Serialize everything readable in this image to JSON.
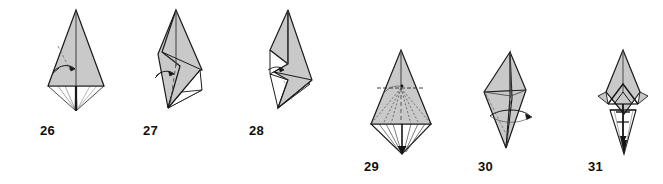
{
  "document": {
    "type": "origami-instruction-diagram",
    "background_color": "#ffffff",
    "paper_front_color": "#c9c9c9",
    "paper_back_color": "#ffffff",
    "outline_color": "#1a1a1a",
    "fold_line_color": "#4a4a4a",
    "arrow_color": "#141414",
    "label_color": "#100f0f",
    "step_count": 6
  },
  "steps": [
    {
      "number": "26",
      "label": "26",
      "name": "step-26",
      "description": "Wide gray kite with vertical center fold, valley-fold arrow at left, thin white flaps tapering to a point below",
      "arrow": "valley-fold-arrow-right",
      "label_x": 40,
      "label_y": 124
    },
    {
      "number": "27",
      "label": "27",
      "name": "step-27",
      "description": "Narrow tilted form, gray front panel folded to the right, dashed vertical fold line, small arrow at left",
      "arrow": "valley-fold-arrow-right",
      "label_x": 143,
      "label_y": 124
    },
    {
      "number": "28",
      "label": "28",
      "name": "step-28",
      "description": "Narrow tilted form with white reverse-side panels exposed on the left edge, zig-zag fold",
      "arrow": "valley-fold-arrow-right",
      "label_x": 249,
      "label_y": 124
    },
    {
      "number": "29",
      "label": "29",
      "name": "step-29",
      "description": "Gray kite with dotted radiating fold lines and a white pleated fan below converging to a dark point",
      "arrow": "fold-down-arrow",
      "label_x": 364,
      "label_y": 160
    },
    {
      "number": "30",
      "label": "30",
      "name": "step-30",
      "description": "Slender tilted kite with dashed center fold and a small arrow pointing right",
      "arrow": "valley-fold-arrow-right",
      "label_x": 478,
      "label_y": 160
    },
    {
      "number": "31",
      "label": "31",
      "name": "step-31",
      "description": "Very narrow elongated finished form with dark arrow markings down the center spine",
      "arrow": "pull-down-arrows",
      "label_x": 588,
      "label_y": 160
    }
  ]
}
